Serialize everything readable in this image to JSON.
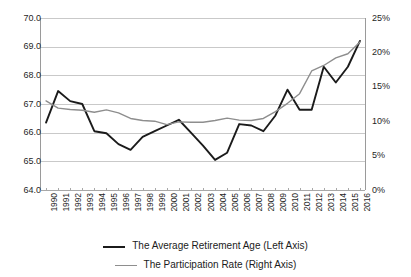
{
  "chart_data": {
    "type": "line",
    "title": "",
    "xlabel": "",
    "ylabel": "",
    "grid": true,
    "legend_position": "bottom",
    "categories": [
      1990,
      1991,
      1992,
      1993,
      1994,
      1995,
      1996,
      1997,
      1998,
      1999,
      2000,
      2001,
      2002,
      2003,
      2004,
      2005,
      2006,
      2007,
      2008,
      2009,
      2010,
      2011,
      2012,
      2013,
      2014,
      2015,
      2016
    ],
    "x_tick_labels": [
      "1990",
      "1991",
      "1992",
      "1993",
      "1994",
      "1995",
      "1996",
      "1997",
      "1998",
      "1999",
      "2000",
      "2001",
      "2002",
      "2003",
      "2004",
      "2005",
      "2006",
      "2007",
      "2008",
      "2009",
      "2010",
      "2011",
      "2012",
      "2013",
      "2014",
      "2015",
      "2016"
    ],
    "axes": {
      "left": {
        "label": "The Average Retirement Age (Left Axis)",
        "ylim": [
          64.0,
          70.0
        ],
        "tick_labels": [
          "70.0",
          "69.0",
          "68.0",
          "67.0",
          "66.0",
          "65.0",
          "64.0"
        ],
        "tick_values": [
          70.0,
          69.0,
          68.0,
          67.0,
          66.0,
          65.0,
          64.0
        ]
      },
      "right": {
        "label": "The Participation Rate (Right Axis)",
        "ylim": [
          0,
          25
        ],
        "tick_labels": [
          "25%",
          "20%",
          "15%",
          "10%",
          "5%",
          "0%"
        ],
        "tick_values": [
          25,
          20,
          15,
          10,
          5,
          0
        ]
      }
    },
    "series": [
      {
        "name": "The Average Retirement Age (Left Axis)",
        "axis": "left",
        "color": "#1b1b1b",
        "width": 1.9,
        "values": [
          66.35,
          67.45,
          67.1,
          67.0,
          66.05,
          65.98,
          65.6,
          65.4,
          65.85,
          66.05,
          66.25,
          66.45,
          66.0,
          65.55,
          65.05,
          65.3,
          66.3,
          66.25,
          66.05,
          66.6,
          67.5,
          66.8,
          66.8,
          68.3,
          67.75,
          68.3,
          69.2
        ]
      },
      {
        "name": "The Participation Rate (Right Axis)",
        "axis": "right",
        "color": "#8e8e8e",
        "width": 1.4,
        "values": [
          12.95,
          11.9,
          11.7,
          11.6,
          11.3,
          11.65,
          11.2,
          10.4,
          10.1,
          10.0,
          9.5,
          9.9,
          9.85,
          9.85,
          10.1,
          10.45,
          10.15,
          10.1,
          10.4,
          11.4,
          12.6,
          14.0,
          17.3,
          18.1,
          19.2,
          19.8,
          21.5
        ]
      }
    ]
  },
  "legend": {
    "items": [
      {
        "label": "The Average Retirement Age (Left Axis)"
      },
      {
        "label": "The Participation Rate (Right Axis)"
      }
    ]
  }
}
